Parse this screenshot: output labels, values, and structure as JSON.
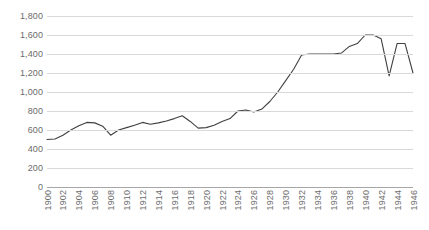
{
  "chart_data": {
    "type": "line",
    "title": "",
    "subtitle": "",
    "xlabel": "",
    "ylabel": "",
    "x": [
      1900,
      1901,
      1902,
      1903,
      1904,
      1905,
      1906,
      1907,
      1908,
      1909,
      1910,
      1911,
      1912,
      1913,
      1914,
      1915,
      1916,
      1917,
      1918,
      1919,
      1920,
      1921,
      1922,
      1923,
      1924,
      1925,
      1926,
      1927,
      1928,
      1929,
      1930,
      1931,
      1932,
      1933,
      1934,
      1935,
      1936,
      1937,
      1938,
      1939,
      1940,
      1941,
      1942,
      1943,
      1944,
      1945,
      1946
    ],
    "values": [
      500,
      505,
      545,
      600,
      645,
      680,
      675,
      640,
      545,
      600,
      625,
      650,
      680,
      660,
      675,
      695,
      720,
      750,
      690,
      620,
      625,
      650,
      690,
      720,
      800,
      810,
      790,
      820,
      900,
      1000,
      1120,
      1240,
      1390,
      1400,
      1400,
      1400,
      1400,
      1410,
      1480,
      1510,
      1600,
      1600,
      1560,
      1170,
      1510,
      1510,
      1200
    ],
    "series": [
      {
        "name": "series-1",
        "color": "#404040",
        "values": [
          500,
          505,
          545,
          600,
          645,
          680,
          675,
          640,
          545,
          600,
          625,
          650,
          680,
          660,
          675,
          695,
          720,
          750,
          690,
          620,
          625,
          650,
          690,
          720,
          800,
          810,
          790,
          820,
          900,
          1000,
          1120,
          1240,
          1390,
          1400,
          1400,
          1400,
          1400,
          1410,
          1480,
          1510,
          1600,
          1600,
          1560,
          1170,
          1510,
          1510,
          1200
        ]
      }
    ],
    "ylim": [
      0,
      1800
    ],
    "y_ticks": [
      0,
      200,
      400,
      600,
      800,
      1000,
      1200,
      1400,
      1600,
      1800
    ],
    "y_tick_labels": [
      "0",
      "200",
      "400",
      "600",
      "800",
      "1,000",
      "1,200",
      "1,400",
      "1,600",
      "1,800"
    ],
    "xlim": [
      1900,
      1946
    ],
    "x_ticks": [
      1900,
      1902,
      1904,
      1906,
      1908,
      1910,
      1912,
      1914,
      1916,
      1918,
      1920,
      1922,
      1924,
      1926,
      1928,
      1930,
      1932,
      1934,
      1936,
      1938,
      1940,
      1942,
      1944,
      1946
    ],
    "x_tick_labels": [
      "1900",
      "1902",
      "1904",
      "1906",
      "1908",
      "1910",
      "1912",
      "1914",
      "1916",
      "1918",
      "1920",
      "1922",
      "1924",
      "1926",
      "1928",
      "1930",
      "1932",
      "1934",
      "1936",
      "1938",
      "1940",
      "1942",
      "1944",
      "1946"
    ],
    "grid": "horizontal",
    "legend": "none",
    "gridline_color": "#d9d9d9",
    "axis_color": "#a6a6a6",
    "tick_label_color": "#6b6b6b",
    "background_color": "#ffffff"
  }
}
